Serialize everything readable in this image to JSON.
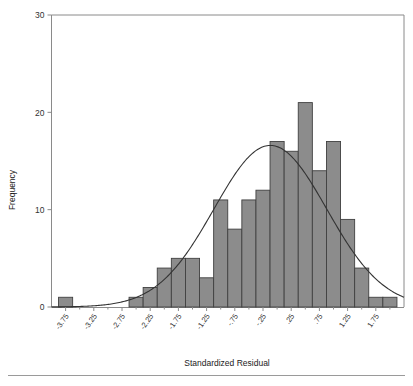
{
  "chart_data": {
    "type": "bar",
    "title": "",
    "subtitle": "",
    "xlabel": "Standardized Residual",
    "ylabel": "Frequency",
    "categories": [
      "-3.75",
      "-3.50",
      "-3.25",
      "-3.00",
      "-2.75",
      "-2.50",
      "-2.25",
      "-2.00",
      "-1.75",
      "-1.50",
      "-1.25",
      "-1.00",
      "-.75",
      "-.50",
      "-.25",
      "0",
      "0.25",
      "0.50",
      "0.75",
      "1.00",
      "1.25",
      "1.50",
      "1.75",
      "2.00"
    ],
    "values": [
      1,
      0,
      0,
      0,
      0,
      1,
      2,
      4,
      5,
      5,
      3,
      11,
      8,
      11,
      12,
      17,
      16,
      21,
      14,
      17,
      9,
      4,
      1,
      1
    ],
    "xtick_labels": [
      "-3.75",
      "-3.25",
      "-2.75",
      "-2.25",
      "-1.75",
      "-1.25",
      "-.75",
      "-.25",
      ".25",
      ".75",
      "1.25",
      "1.75"
    ],
    "ytick_labels": [
      "0",
      "10",
      "20",
      "30"
    ],
    "ytick_values": [
      0,
      10,
      20,
      30
    ],
    "ylim": [
      0,
      30
    ],
    "xlim": [
      -4.0,
      2.25
    ],
    "grid": false,
    "legend": "none",
    "overlay": {
      "name": "normal-curve",
      "type": "line",
      "mean": -0.12,
      "stddev": 1.0,
      "peak_frequency": 16.6
    },
    "bar_color": "#8c8c8c",
    "bar_edge_color": "#404040",
    "curve_color": "#333333",
    "axis_color": "#8a8a8a"
  },
  "footer": {
    "divider": true,
    "caption": ""
  }
}
